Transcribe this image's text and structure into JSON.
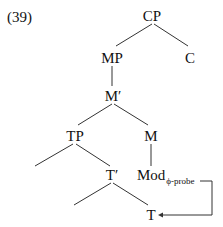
{
  "example_number": "(39)",
  "tree": {
    "nodes": [
      {
        "id": "CP",
        "label": "CP"
      },
      {
        "id": "MP",
        "label": "MP"
      },
      {
        "id": "C",
        "label": "C"
      },
      {
        "id": "Mbar",
        "label": "M′"
      },
      {
        "id": "TP",
        "label": "TP"
      },
      {
        "id": "M",
        "label": "M"
      },
      {
        "id": "Tbar",
        "label": "T′"
      },
      {
        "id": "Mod",
        "label": "Mod",
        "subscript": "ϕ-probe"
      },
      {
        "id": "T",
        "label": "T"
      }
    ],
    "edges": [
      [
        "CP",
        "MP"
      ],
      [
        "CP",
        "C"
      ],
      [
        "MP",
        "Mbar"
      ],
      [
        "Mbar",
        "TP"
      ],
      [
        "Mbar",
        "M"
      ],
      [
        "TP",
        "spec-TP"
      ],
      [
        "TP",
        "Tbar"
      ],
      [
        "M",
        "Mod"
      ],
      [
        "Tbar",
        "spec-Tbar"
      ],
      [
        "Tbar",
        "T"
      ]
    ],
    "arrow": {
      "from": "Mod",
      "to": "T",
      "description": "Agree arrow from Mod ϕ-probe to T"
    }
  }
}
